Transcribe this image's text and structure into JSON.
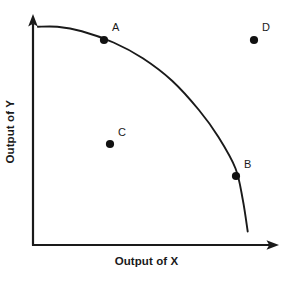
{
  "chart_data": {
    "type": "line",
    "title": "",
    "subtitle": "",
    "xlabel": "Output of X",
    "ylabel": "Output of Y",
    "grid": false,
    "legend": null,
    "legend_position": "none",
    "axis_style": "arrow",
    "xlim": [
      0,
      100
    ],
    "ylim": [
      0,
      100
    ],
    "xticks": [],
    "yticks": [],
    "series": [
      {
        "name": "Production Possibilities Frontier",
        "type": "line",
        "color": "#1a1a1a",
        "x": [
          2,
          10,
          20,
          33,
          45,
          57,
          68,
          76,
          83,
          86,
          88
        ],
        "y": [
          97,
          97,
          95,
          90,
          83,
          73,
          60,
          48,
          34,
          20,
          6
        ]
      }
    ],
    "points": [
      {
        "label": "A",
        "x": 33,
        "y": 90,
        "position": "on-curve",
        "px": 104,
        "py": 40,
        "label_px": 112,
        "label_py": 22,
        "color": "#111111"
      },
      {
        "label": "B",
        "x": 83,
        "y": 34,
        "position": "on-curve",
        "px": 236,
        "py": 176,
        "label_px": 244,
        "label_py": 159,
        "color": "#111111"
      },
      {
        "label": "C",
        "x": 35,
        "y": 45,
        "position": "inside-curve",
        "px": 110,
        "py": 144,
        "label_px": 118,
        "label_py": 127,
        "color": "#111111"
      },
      {
        "label": "D",
        "x": 90,
        "y": 90,
        "position": "outside-curve",
        "px": 254,
        "py": 40,
        "label_px": 262,
        "label_py": 22,
        "color": "#111111"
      }
    ],
    "annotations": []
  },
  "figure": {
    "background_color": "#ffffff",
    "axis_color": "#1a1a1a",
    "curve_color": "#1a1a1a",
    "point_color": "#111111",
    "text_color": "#1a1a1a"
  },
  "axes": {
    "x_title": "Output of X",
    "y_title": "Output of Y"
  },
  "points": {
    "a": "A",
    "b": "B",
    "c": "C",
    "d": "D"
  }
}
